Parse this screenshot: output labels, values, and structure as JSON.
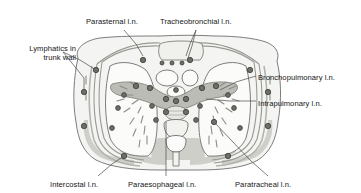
{
  "figure": {
    "view": "axial cross-section of the thorax at the level of the pulmonary hila",
    "palette": {
      "background": "#ffffff",
      "outline": "#6e6e6e",
      "body_wall_fill": "#f4f4f2",
      "muscle_fill": "#c9c9c4",
      "lung_fill": "#fbfbfa",
      "mediastinum_fill": "#bcbcb6",
      "node_fill": "#6b6f66",
      "node_stroke": "#3a3d37",
      "lymph_vessel": "#8d8d86",
      "leader_line": "#4a4a4a",
      "text": "#151515"
    },
    "labels": [
      {
        "id": "parasternal",
        "text": "Parasternal l.n.",
        "x": 86,
        "y": 17,
        "align": "left"
      },
      {
        "id": "tracheobronchial",
        "text": "Tracheobronchial l.n.",
        "x": 160,
        "y": 17,
        "align": "left"
      },
      {
        "id": "lymphatics-trunk",
        "text": "Lymphatics in trunk wall",
        "x": 2,
        "y": 44,
        "align": "right",
        "lines": [
          "Lymphatics in",
          "trunk wall"
        ]
      },
      {
        "id": "bronchopulmonary",
        "text": "Bronchopulmonary l.n.",
        "x": 258,
        "y": 73,
        "align": "left"
      },
      {
        "id": "intrapulmonary",
        "text": "Intrapulmonary l.n.",
        "x": 258,
        "y": 99,
        "align": "left"
      },
      {
        "id": "intercostal",
        "text": "Intercostal l.n.",
        "x": 50,
        "y": 180,
        "align": "left"
      },
      {
        "id": "paraesophageal",
        "text": "Paraesophageal l.n.",
        "x": 128,
        "y": 180,
        "align": "left"
      },
      {
        "id": "paratracheal",
        "text": "Paratracheal l.n.",
        "x": 235,
        "y": 180,
        "align": "left"
      }
    ],
    "node_groups": [
      {
        "name": "parasternal",
        "count": 5
      },
      {
        "name": "tracheobronchial",
        "count": 4
      },
      {
        "name": "bronchopulmonary",
        "count": 4
      },
      {
        "name": "intrapulmonary",
        "count": 6
      },
      {
        "name": "intercostal",
        "count": 6
      },
      {
        "name": "paraesophageal",
        "count": 2
      },
      {
        "name": "paratracheal",
        "count": 2
      },
      {
        "name": "trunk-wall",
        "count": 5
      }
    ]
  }
}
